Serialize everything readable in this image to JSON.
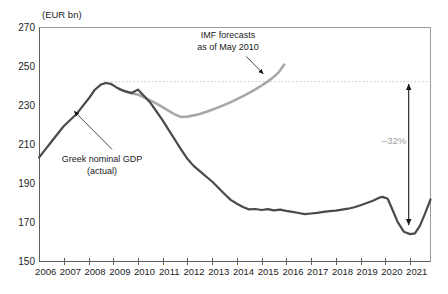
{
  "chart_data": {
    "type": "line",
    "unit_label": "(EUR bn)",
    "x_axis": {
      "domain": [
        2006,
        2021.83
      ],
      "tick_years": [
        2007,
        2008,
        2009,
        2010,
        2011,
        2012,
        2013,
        2014,
        2015,
        2016,
        2017,
        2018,
        2019,
        2020,
        2021
      ],
      "labels": [
        "2006",
        "2007",
        "2008",
        "2009",
        "2010",
        "2011",
        "2012",
        "2013",
        "2014",
        "2015",
        "2016",
        "2017",
        "2018",
        "2019",
        "2020",
        "2021"
      ],
      "label_offset_years": 0.27
    },
    "y_axis": {
      "domain": [
        150,
        270
      ],
      "ticks": [
        270,
        250,
        230,
        210,
        190,
        170,
        150
      ],
      "labels": [
        "270",
        "250",
        "230",
        "210",
        "190",
        "170",
        "150"
      ]
    },
    "series": [
      {
        "name": "IMF forecasts as of May 2010",
        "color": "#a8a8a8",
        "stroke_width": 2.6,
        "points": [
          [
            2009.25,
            238.4
          ],
          [
            2009.5,
            237.3
          ],
          [
            2009.75,
            236.3
          ],
          [
            2010.0,
            235.7
          ],
          [
            2010.25,
            234.3
          ],
          [
            2010.5,
            232.7
          ],
          [
            2010.75,
            231.0
          ],
          [
            2011.0,
            229.2
          ],
          [
            2011.25,
            227.3
          ],
          [
            2011.5,
            225.5
          ],
          [
            2011.75,
            224.2
          ],
          [
            2012.0,
            224.4
          ],
          [
            2012.25,
            225.0
          ],
          [
            2012.5,
            225.8
          ],
          [
            2012.75,
            226.8
          ],
          [
            2013.0,
            227.9
          ],
          [
            2013.25,
            229.1
          ],
          [
            2013.5,
            230.4
          ],
          [
            2013.75,
            231.8
          ],
          [
            2014.0,
            233.3
          ],
          [
            2014.25,
            234.9
          ],
          [
            2014.5,
            236.6
          ],
          [
            2014.75,
            238.4
          ],
          [
            2015.0,
            240.3
          ],
          [
            2015.25,
            242.4
          ],
          [
            2015.5,
            244.8
          ],
          [
            2015.7,
            247.2
          ],
          [
            2015.92,
            251.0
          ]
        ]
      },
      {
        "name": "Greek nominal GDP (actual)",
        "color": "#4a4a4a",
        "stroke_width": 2.2,
        "points": [
          [
            2006.0,
            203.5
          ],
          [
            2006.25,
            207.5
          ],
          [
            2006.5,
            211.5
          ],
          [
            2006.75,
            215.5
          ],
          [
            2007.0,
            219.5
          ],
          [
            2007.25,
            222.5
          ],
          [
            2007.5,
            225.5
          ],
          [
            2007.75,
            229.5
          ],
          [
            2008.0,
            233.5
          ],
          [
            2008.25,
            238.0
          ],
          [
            2008.5,
            240.8
          ],
          [
            2008.7,
            241.6
          ],
          [
            2008.9,
            241.2
          ],
          [
            2009.1,
            239.6
          ],
          [
            2009.3,
            238.3
          ],
          [
            2009.5,
            237.3
          ],
          [
            2009.75,
            236.5
          ],
          [
            2010.0,
            238.2
          ],
          [
            2010.25,
            235.0
          ],
          [
            2010.5,
            231.5
          ],
          [
            2010.75,
            227.0
          ],
          [
            2011.0,
            222.5
          ],
          [
            2011.25,
            217.5
          ],
          [
            2011.5,
            212.5
          ],
          [
            2011.75,
            207.5
          ],
          [
            2012.0,
            202.8
          ],
          [
            2012.25,
            199.2
          ],
          [
            2012.5,
            196.5
          ],
          [
            2012.75,
            193.8
          ],
          [
            2013.0,
            191.2
          ],
          [
            2013.25,
            188.0
          ],
          [
            2013.5,
            184.8
          ],
          [
            2013.75,
            181.8
          ],
          [
            2014.0,
            179.8
          ],
          [
            2014.25,
            178.2
          ],
          [
            2014.5,
            176.9
          ],
          [
            2014.75,
            177.1
          ],
          [
            2015.0,
            176.6
          ],
          [
            2015.25,
            177.0
          ],
          [
            2015.5,
            176.4
          ],
          [
            2015.75,
            176.8
          ],
          [
            2016.0,
            176.2
          ],
          [
            2016.25,
            175.7
          ],
          [
            2016.5,
            175.1
          ],
          [
            2016.75,
            174.5
          ],
          [
            2017.0,
            174.8
          ],
          [
            2017.25,
            175.2
          ],
          [
            2017.5,
            175.7
          ],
          [
            2017.75,
            176.0
          ],
          [
            2018.0,
            176.3
          ],
          [
            2018.25,
            176.8
          ],
          [
            2018.5,
            177.3
          ],
          [
            2018.75,
            178.0
          ],
          [
            2019.0,
            179.0
          ],
          [
            2019.25,
            180.2
          ],
          [
            2019.5,
            181.3
          ],
          [
            2019.75,
            182.9
          ],
          [
            2019.9,
            183.3
          ],
          [
            2020.1,
            182.4
          ],
          [
            2020.3,
            176.5
          ],
          [
            2020.5,
            170.5
          ],
          [
            2020.75,
            165.5
          ],
          [
            2021.0,
            164.3
          ],
          [
            2021.2,
            164.7
          ],
          [
            2021.4,
            168.5
          ],
          [
            2021.6,
            174.5
          ],
          [
            2021.83,
            182.0
          ]
        ]
      }
    ],
    "reference_line": {
      "value": 242.3,
      "from_year": 2008.62,
      "style": "dotted",
      "color": "#c6c6c6"
    },
    "annotations": {
      "forecast_label": {
        "lines": [
          "IMF forecasts",
          "as of May 2010"
        ]
      },
      "forecast_arrow": {
        "from": [
          2014.38,
          255.2
        ],
        "to": [
          2015.07,
          246.3
        ]
      },
      "actual_label": {
        "lines": [
          "Greek nominal GDP",
          "(actual)"
        ]
      },
      "actual_arrow": {
        "from": [
          2008.95,
          207.6
        ],
        "to": [
          2007.42,
          227.2
        ]
      },
      "delta_label": {
        "text": "–32%",
        "color": "#9b9b9b"
      },
      "delta_arrow": {
        "year": 2020.95,
        "from_value": 242.3,
        "to_value": 169.0
      }
    }
  }
}
